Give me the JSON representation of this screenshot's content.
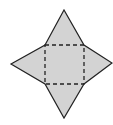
{
  "diagram": {
    "type": "square-pyramid-net",
    "fill": "#d3d3d3",
    "stroke": "#222222",
    "fold_line_style": "dashed",
    "base_square": [
      [
        45,
        45
      ],
      [
        84,
        45
      ],
      [
        84,
        84
      ],
      [
        45,
        84
      ]
    ],
    "triangles": {
      "top": [
        [
          45,
          45
        ],
        [
          64,
          10
        ],
        [
          84,
          45
        ]
      ],
      "right": [
        [
          84,
          45
        ],
        [
          113,
          63
        ],
        [
          84,
          84
        ]
      ],
      "bottom": [
        [
          84,
          84
        ],
        [
          64,
          118
        ],
        [
          45,
          84
        ]
      ],
      "left": [
        [
          45,
          84
        ],
        [
          11,
          64
        ],
        [
          45,
          45
        ]
      ]
    }
  }
}
